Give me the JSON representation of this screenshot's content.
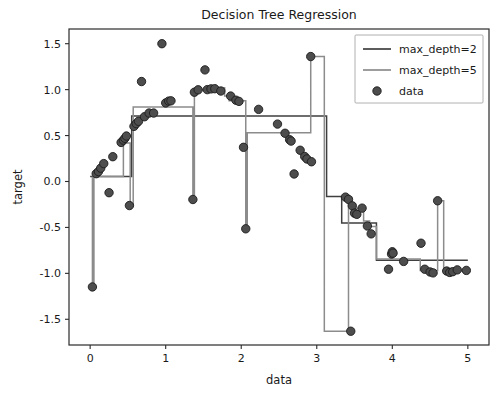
{
  "figure": {
    "title": "Decision Tree Regression",
    "background_color": "#ffffff",
    "width": 504,
    "height": 393
  },
  "axes": {
    "xlabel": "data",
    "ylabel": "target",
    "x_ticks": [
      "0",
      "1",
      "2",
      "3",
      "4",
      "5"
    ],
    "y_ticks": [
      "1.5",
      "1.0",
      "0.5",
      "0.0",
      "-0.5",
      "-1.0",
      "-1.5"
    ],
    "xlim": [
      -0.28,
      5.28
    ],
    "ylim": [
      -1.78,
      1.66
    ],
    "grid": "off",
    "spine_color": "#2b2b2b"
  },
  "legend": {
    "position": "upper right",
    "entries": [
      {
        "label": "max_depth=2",
        "kind": "line",
        "color": "#3f3f3f"
      },
      {
        "label": "max_depth=5",
        "kind": "line",
        "color": "#8c8c8c"
      },
      {
        "label": "data",
        "kind": "marker",
        "color": "#4d4d4d"
      }
    ]
  },
  "chart_data": {
    "type": "line",
    "title": "Decision Tree Regression",
    "xlabel": "data",
    "ylabel": "target",
    "xlim": [
      -0.28,
      5.28
    ],
    "ylim": [
      -1.78,
      1.66
    ],
    "grid": "off",
    "legend_position": "upper right",
    "series": [
      {
        "name": "max_depth=2",
        "kind": "step",
        "color": "#3f3f3f",
        "linewidth": 1.5,
        "x": [
          0.0,
          0.55,
          0.55,
          3.13,
          3.13,
          3.33,
          3.33,
          3.79,
          3.79,
          5.0
        ],
        "y": [
          0.055,
          0.055,
          0.712,
          0.712,
          -0.163,
          -0.163,
          -0.452,
          -0.452,
          -0.857,
          -0.857
        ]
      },
      {
        "name": "max_depth=5",
        "kind": "step",
        "color": "#8c8c8c",
        "linewidth": 1.5,
        "x": [
          0.03,
          0.03,
          0.05,
          0.05,
          0.44,
          0.44,
          0.52,
          0.52,
          0.53,
          0.53,
          0.57,
          0.57,
          1.36,
          1.36,
          1.38,
          1.38,
          1.42,
          1.42,
          1.57,
          1.57,
          1.78,
          1.78,
          1.84,
          1.84,
          2.02,
          2.02,
          2.06,
          2.06,
          2.08,
          2.08,
          2.11,
          2.11,
          2.92,
          2.92,
          2.96,
          2.96,
          3.1,
          3.1,
          3.42,
          3.42,
          3.46,
          3.46,
          3.5,
          3.5,
          3.62,
          3.62,
          3.7,
          3.7,
          3.79,
          3.79,
          3.94,
          3.94,
          4.37,
          4.37,
          4.6,
          4.6,
          4.64,
          4.64,
          4.68,
          4.68,
          5.0
        ],
        "y": [
          0.055,
          -1.148,
          -1.148,
          0.055,
          0.055,
          0.42,
          0.42,
          0.42,
          0.42,
          -0.262,
          -0.262,
          0.812,
          0.812,
          -0.196,
          -0.196,
          1.0,
          1.0,
          1.0,
          1.0,
          1.02,
          1.02,
          0.93,
          0.93,
          0.88,
          0.88,
          0.88,
          0.88,
          -0.515,
          -0.515,
          0.53,
          0.53,
          0.53,
          0.53,
          1.36,
          1.36,
          1.36,
          1.36,
          -1.63,
          -1.63,
          -0.17,
          -0.17,
          -0.35,
          -0.35,
          -0.29,
          -0.29,
          -0.43,
          -0.43,
          -0.49,
          -0.49,
          -0.845,
          -0.845,
          -0.845,
          -0.845,
          -0.97,
          -0.97,
          -0.21,
          -0.21,
          -0.21,
          -0.21,
          -0.975,
          -0.975
        ]
      }
    ],
    "scatter": {
      "name": "data",
      "marker": "o",
      "facecolor": "#4d4d4d",
      "edgecolor": "#1c1c1c",
      "size": 4.2,
      "points": [
        [
          0.03,
          -1.148
        ],
        [
          0.08,
          0.085
        ],
        [
          0.11,
          0.108
        ],
        [
          0.14,
          0.145
        ],
        [
          0.18,
          0.195
        ],
        [
          0.25,
          -0.122
        ],
        [
          0.3,
          0.27
        ],
        [
          0.41,
          0.425
        ],
        [
          0.44,
          0.45
        ],
        [
          0.46,
          0.47
        ],
        [
          0.48,
          0.495
        ],
        [
          0.52,
          -0.262
        ],
        [
          0.58,
          0.6
        ],
        [
          0.61,
          0.63
        ],
        [
          0.64,
          0.655
        ],
        [
          0.68,
          1.088
        ],
        [
          0.72,
          0.705
        ],
        [
          0.78,
          0.745
        ],
        [
          0.84,
          0.745
        ],
        [
          0.95,
          1.5
        ],
        [
          1.0,
          0.855
        ],
        [
          1.04,
          0.875
        ],
        [
          1.07,
          0.878
        ],
        [
          1.36,
          -0.196
        ],
        [
          1.38,
          0.972
        ],
        [
          1.43,
          0.998
        ],
        [
          1.52,
          1.215
        ],
        [
          1.55,
          1.0
        ],
        [
          1.6,
          1.008
        ],
        [
          1.65,
          1.01
        ],
        [
          1.73,
          0.985
        ],
        [
          1.86,
          0.93
        ],
        [
          1.93,
          0.885
        ],
        [
          1.97,
          0.872
        ],
        [
          2.03,
          0.372
        ],
        [
          2.06,
          -0.515
        ],
        [
          2.23,
          0.785
        ],
        [
          2.48,
          0.625
        ],
        [
          2.58,
          0.525
        ],
        [
          2.64,
          0.455
        ],
        [
          2.66,
          0.44
        ],
        [
          2.7,
          0.082
        ],
        [
          2.78,
          0.34
        ],
        [
          2.84,
          0.272
        ],
        [
          2.87,
          0.245
        ],
        [
          2.92,
          1.36
        ],
        [
          2.93,
          0.215
        ],
        [
          3.38,
          -0.17
        ],
        [
          3.42,
          -0.195
        ],
        [
          3.45,
          -1.63
        ],
        [
          3.47,
          -0.265
        ],
        [
          3.5,
          -0.345
        ],
        [
          3.53,
          -0.358
        ],
        [
          3.6,
          -0.29
        ],
        [
          3.67,
          -0.485
        ],
        [
          3.72,
          -0.57
        ],
        [
          3.95,
          -0.955
        ],
        [
          3.99,
          -0.79
        ],
        [
          4.0,
          -0.765
        ],
        [
          4.01,
          -0.78
        ],
        [
          4.15,
          -0.87
        ],
        [
          4.38,
          -0.672
        ],
        [
          4.43,
          -0.955
        ],
        [
          4.5,
          -0.985
        ],
        [
          4.54,
          -0.995
        ],
        [
          4.6,
          -0.21
        ],
        [
          4.72,
          -0.975
        ],
        [
          4.76,
          -0.99
        ],
        [
          4.8,
          -0.982
        ],
        [
          4.86,
          -0.962
        ],
        [
          4.98,
          -0.968
        ]
      ]
    }
  }
}
